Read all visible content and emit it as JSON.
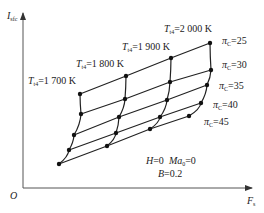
{
  "chart_data": {
    "type": "line",
    "title": "",
    "xlabel": "F_s",
    "ylabel": "I_sfc",
    "origin_label": "O",
    "grid": false,
    "conditions": [
      "H=0  Ma0=0",
      "B=0.2"
    ],
    "families": {
      "T_t4": [
        "1700 K",
        "1800 K",
        "1900 K",
        "2000 K"
      ],
      "pi_C": [
        "25",
        "30",
        "35",
        "40",
        "45"
      ]
    },
    "series": [
      {
        "name": "πC=25",
        "points_px": [
          [
            80,
            94
          ],
          [
            126,
            76
          ],
          [
            171,
            58
          ],
          [
            210,
            43
          ]
        ]
      },
      {
        "name": "πC=30",
        "points_px": [
          [
            81,
            114
          ],
          [
            125,
            99
          ],
          [
            170,
            82
          ],
          [
            211,
            70
          ]
        ]
      },
      {
        "name": "πC=35",
        "points_px": [
          [
            74,
            135
          ],
          [
            119,
            117
          ],
          [
            167,
            100
          ],
          [
            207,
            85
          ]
        ]
      },
      {
        "name": "πC=40",
        "points_px": [
          [
            69,
            150
          ],
          [
            116,
            133
          ],
          [
            160,
            117
          ],
          [
            201,
            103
          ]
        ]
      },
      {
        "name": "πC=45",
        "points_px": [
          [
            59,
            164
          ],
          [
            107,
            146
          ],
          [
            150,
            129
          ],
          [
            189,
            116
          ]
        ]
      }
    ],
    "note": "Schematic carpet plot; axes have no numeric ticks, positions are pixel estimates"
  },
  "labels": {
    "y_axis": "I",
    "y_axis_sub": "sfc",
    "x_axis": "F",
    "x_axis_sub": "s",
    "origin": "O",
    "t_prefix": "T",
    "t_sub": "t4",
    "t1700": "=1 700 K",
    "t1800": "=1 800 K",
    "t1900": "=1 900 K",
    "t2000": "=2 000 K",
    "pi_prefix": "π",
    "pi_sub": "C",
    "pi25": "=25",
    "pi30": "=30",
    "pi35": "=35",
    "pi40": "=40",
    "pi45": "=45",
    "cond_h": "H",
    "cond_h_val": "=0",
    "cond_ma": "Ma",
    "cond_ma_sub": "0",
    "cond_ma_val": "=0",
    "cond_b": "B",
    "cond_b_val": "=0.2"
  },
  "colors": {
    "line": "#222222",
    "axis": "#555555"
  }
}
